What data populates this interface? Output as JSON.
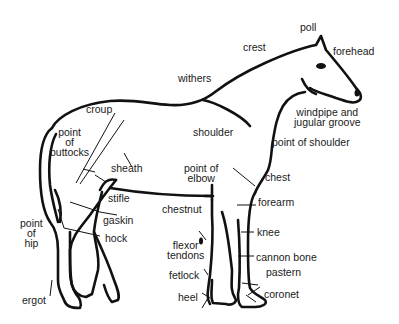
{
  "diagram": {
    "colors": {
      "outline": "#111111",
      "text": "#1a1a1a",
      "background": "#ffffff"
    },
    "labels": [
      {
        "id": "poll",
        "text": "poll"
      },
      {
        "id": "crest",
        "text": "crest"
      },
      {
        "id": "forehead",
        "text": "forehead"
      },
      {
        "id": "withers",
        "text": "withers"
      },
      {
        "id": "croup",
        "text": "croup"
      },
      {
        "id": "windpipe",
        "text": "windpipe and\njugular groove"
      },
      {
        "id": "shoulder",
        "text": "shoulder"
      },
      {
        "id": "point_of_shoulder",
        "text": "point of shoulder"
      },
      {
        "id": "point_of_buttocks",
        "text": "point\nof\nbuttocks"
      },
      {
        "id": "sheath",
        "text": "sheath"
      },
      {
        "id": "point_of_elbow",
        "text": "point of\nelbow"
      },
      {
        "id": "chest",
        "text": "chest"
      },
      {
        "id": "stifle",
        "text": "stifle"
      },
      {
        "id": "forearm",
        "text": "forearm"
      },
      {
        "id": "chestnut",
        "text": "chestnut"
      },
      {
        "id": "gaskin",
        "text": "gaskin"
      },
      {
        "id": "point_of_hip",
        "text": "point\nof\nhip"
      },
      {
        "id": "hock",
        "text": "hock"
      },
      {
        "id": "knee",
        "text": "knee"
      },
      {
        "id": "flexor_tendons",
        "text": "flexor\ntendons"
      },
      {
        "id": "cannon_bone",
        "text": "cannon bone"
      },
      {
        "id": "fetlock",
        "text": "fetlock"
      },
      {
        "id": "pastern",
        "text": "pastern"
      },
      {
        "id": "heel",
        "text": "heel"
      },
      {
        "id": "coronet",
        "text": "coronet"
      },
      {
        "id": "ergot",
        "text": "ergot"
      }
    ]
  }
}
